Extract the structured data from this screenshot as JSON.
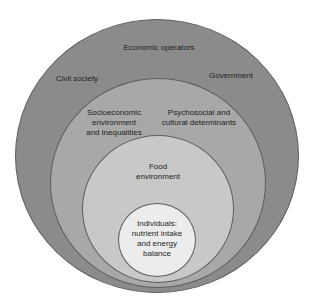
{
  "diagram": {
    "type": "nested-circles",
    "layers": [
      {
        "id": "outer",
        "color": "#8b8b8b",
        "labels": [
          "Economic operators",
          "Civil society",
          "Government"
        ]
      },
      {
        "id": "second",
        "color": "#a8a8a8",
        "labels": [
          "Socioeconomic\nenvironment\nand inequalities",
          "Psychosocial and\ncultural determinants"
        ]
      },
      {
        "id": "third",
        "color": "#c8c8c8",
        "labels": [
          "Food\nenvironment"
        ]
      },
      {
        "id": "inner",
        "color": "#ececec",
        "labels": [
          "Individuals:\nnutrient intake\nand energy\nbalance"
        ]
      }
    ]
  },
  "labels": {
    "economic_operators": "Economic operators",
    "civil_society": "Civil society",
    "government": "Government",
    "socioeconomic": "Socioeconomic\nenvironment\nand inequalities",
    "psychosocial": "Psychosocial and\ncultural determinants",
    "food_environment": "Food\nenvironment",
    "individuals": "Individuals:\nnutrient intake\nand energy\nbalance"
  }
}
